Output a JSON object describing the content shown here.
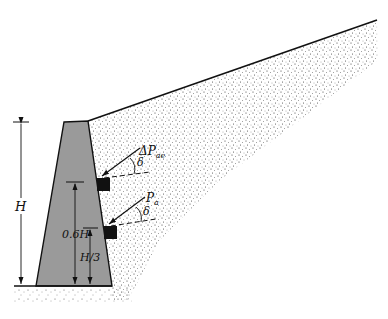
{
  "figure": {
    "type": "retaining-wall-seismic-earth-pressure",
    "colors": {
      "wall_fill": "#9a9a9a",
      "line": "#111111",
      "block": "#111111",
      "soil_dots": "#333333"
    }
  },
  "labels": {
    "height_total": "H",
    "height_dynamic": "0.6H",
    "height_static": "H/3",
    "dynamic_force": "ΔP",
    "dynamic_force_sub": "ae",
    "static_force": "P",
    "static_force_sub": "a",
    "friction_angle_1": "δ",
    "friction_angle_2": "δ"
  }
}
